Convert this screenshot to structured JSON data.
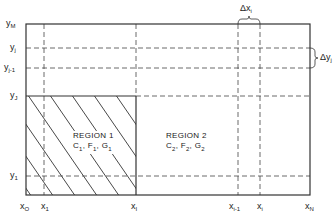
{
  "diagram": {
    "title": "",
    "y_axis_labels": [
      {
        "id": "yM",
        "base": "y",
        "sub": "M"
      },
      {
        "id": "yj",
        "base": "y",
        "sub": "j"
      },
      {
        "id": "yj-1",
        "base": "y",
        "sub": "j-1"
      },
      {
        "id": "yJ",
        "base": "y",
        "sub": "J"
      },
      {
        "id": "y1",
        "base": "y",
        "sub": "1"
      }
    ],
    "x_axis_labels": [
      {
        "id": "xO",
        "base": "x",
        "sub": "O"
      },
      {
        "id": "x1",
        "base": "x",
        "sub": "1"
      },
      {
        "id": "xI",
        "base": "x",
        "sub": "I"
      },
      {
        "id": "xi-1",
        "base": "x",
        "sub": "i-1"
      },
      {
        "id": "xi",
        "base": "x",
        "sub": "i"
      },
      {
        "id": "xN",
        "base": "x",
        "sub": "N"
      }
    ],
    "delta_x": {
      "base": "Δx",
      "sub": "i"
    },
    "delta_y": {
      "base": "Δy",
      "sub": "j"
    },
    "region1": {
      "title": "REGION 1",
      "params": "C1, F1, G1",
      "c": "C",
      "f": "F",
      "g": "G",
      "sub": "1"
    },
    "region2": {
      "title": "REGION 2",
      "params": "C2, F2, G2",
      "c": "C",
      "f": "F",
      "g": "G",
      "sub": "2"
    },
    "colors": {
      "line": "#333333",
      "background": "#ffffff"
    }
  }
}
